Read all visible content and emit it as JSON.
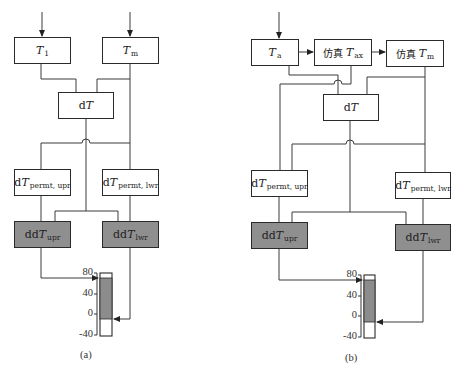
{
  "figure": {
    "panels": [
      {
        "id": "a",
        "caption": "(a)",
        "boxes": {
          "t_input": {
            "main": "T",
            "sub": "1"
          },
          "t_m": {
            "main": "T",
            "sub": "m"
          },
          "dt": {
            "prefix": "d",
            "main": "T"
          },
          "dt_permt_upr": {
            "prefix": "d",
            "main": "T",
            "sub": "permt, upr"
          },
          "dt_permt_lwr": {
            "prefix": "d",
            "main": "T",
            "sub": "permt, lwr"
          },
          "ddt_upr": {
            "prefix": "dd",
            "main": "T",
            "sub": "upr"
          },
          "ddt_lwr": {
            "prefix": "dd",
            "main": "T",
            "sub": "lwr"
          }
        },
        "gauge": {
          "ticks": [
            "80",
            "40",
            "0",
            "-40"
          ],
          "upper_value": 72,
          "lower_value": -12
        }
      },
      {
        "id": "b",
        "caption": "(b)",
        "boxes": {
          "t_a": {
            "main": "T",
            "sub": "a"
          },
          "sim_t_ax": {
            "prefix": "仿真",
            "main": "T",
            "sub": "ax"
          },
          "sim_t_m": {
            "prefix": "仿真",
            "main": "T",
            "sub": "m"
          },
          "dt": {
            "prefix": "d",
            "main": "T"
          },
          "dt_permt_upr": {
            "prefix": "d",
            "main": "T",
            "sub": "permt, upr"
          },
          "dt_permt_lwr": {
            "prefix": "d",
            "main": "T",
            "sub": "permt, lwr"
          },
          "ddt_upr": {
            "prefix": "dd",
            "main": "T",
            "sub": "upr"
          },
          "ddt_lwr": {
            "prefix": "dd",
            "main": "T",
            "sub": "lwr"
          }
        },
        "gauge": {
          "ticks": [
            "80",
            "40",
            "0",
            "-40"
          ],
          "upper_value": 72,
          "lower_value": -12
        }
      }
    ],
    "colors": {
      "line": "#3a3a3a",
      "shaded_box": "#8f8f8f",
      "gauge_fill": "#8c8c8c"
    }
  }
}
